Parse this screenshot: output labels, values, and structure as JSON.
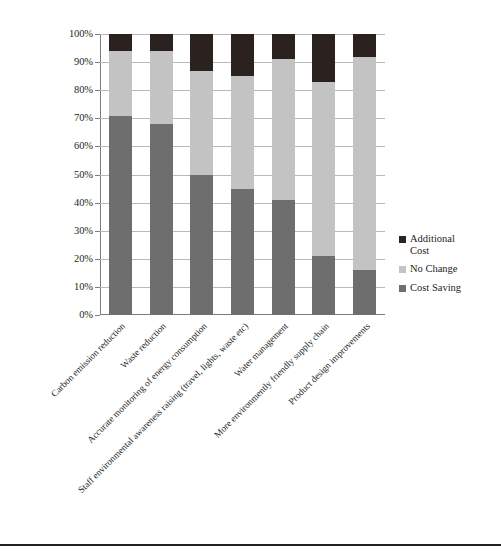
{
  "chart_data": {
    "type": "bar",
    "subtype": "stacked-100-percent",
    "title": "",
    "xlabel": "",
    "ylabel": "",
    "ylim": [
      0,
      100
    ],
    "y_unit": "%",
    "grid": true,
    "legend_position": "right",
    "categories": [
      "Carbon emission reduction",
      "Waste reduction",
      "Accurate monitoring of energy consumption",
      "Staff environmental awareness raising (travel, lights, waste etc)",
      "Water management",
      "More environmently friendly supply chain",
      "Product design improvements"
    ],
    "ytick_labels": [
      "0%",
      "10%",
      "20%",
      "30%",
      "40%",
      "50%",
      "60%",
      "70%",
      "80%",
      "90%",
      "100%"
    ],
    "ytick_values": [
      0,
      10,
      20,
      30,
      40,
      50,
      60,
      70,
      80,
      90,
      100
    ],
    "series": [
      {
        "name": "Cost Saving",
        "color": "#6e6e6e",
        "values": [
          71,
          68,
          50,
          45,
          41,
          21,
          16
        ]
      },
      {
        "name": "No Change",
        "color": "#c3c3c3",
        "values": [
          23,
          26,
          37,
          40,
          50,
          62,
          76
        ]
      },
      {
        "name": "Additional Cost",
        "color": "#2b2220",
        "values": [
          6,
          6,
          13,
          15,
          9,
          17,
          8
        ]
      }
    ],
    "legend_order": [
      "Additional Cost",
      "No Change",
      "Cost Saving"
    ]
  },
  "legend": {
    "items": [
      {
        "label": "Additional Cost",
        "color": "#2b2220"
      },
      {
        "label": "No Change",
        "color": "#c3c3c3"
      },
      {
        "label": "Cost Saving",
        "color": "#6e6e6e"
      }
    ]
  }
}
